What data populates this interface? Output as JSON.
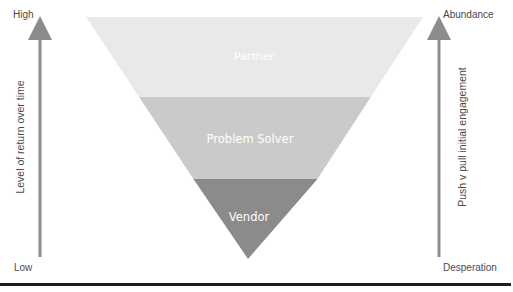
{
  "left_axis": {
    "top_label": "High",
    "bottom_label": "Low",
    "title": "Level of return over time",
    "arrow_color": "#8c8c8c"
  },
  "right_axis": {
    "top_label": "Abundance",
    "bottom_label": "Desperation",
    "title": "Push v pull initial engagement",
    "arrow_color": "#8c8c8c"
  },
  "funnel": {
    "layers": [
      {
        "label": "Partner",
        "color": "#e8e8e8"
      },
      {
        "label": "Problem Solver",
        "color": "#c9c9c9"
      },
      {
        "label": "Vendor",
        "color": "#8a8a8a"
      }
    ]
  }
}
